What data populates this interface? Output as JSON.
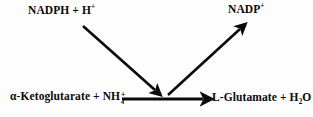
{
  "figure": {
    "kind": "biochemical-reaction-scheme",
    "background_color": "#fdfdfd",
    "stroke_color": "#0a0a0a",
    "width": 313,
    "height": 117
  },
  "species": {
    "reductant": {
      "name": "NADPH + H",
      "charge": "+",
      "full_text": "NADPH + H+"
    },
    "oxidant": {
      "name": "NADP",
      "charge": "+",
      "full_text": "NADP+"
    },
    "substrate": {
      "prefix": "α-Ketoglutarate + NH",
      "subscript": "4",
      "charge": "+",
      "full_text": "α-Ketoglutarate + NH4+"
    },
    "product": {
      "prefix": "L-Glutamate + H",
      "subscript": "2",
      "suffix": "O",
      "full_text": "L-Glutamate + H2O"
    }
  },
  "arrows": [
    {
      "id": "cofactor-in",
      "label": "NADPH + H+ consumed",
      "from": [
        83,
        26
      ],
      "to": [
        158,
        93
      ],
      "style": "solid-diagonal-down-right"
    },
    {
      "id": "cofactor-out",
      "label": "NADP+ released",
      "from": [
        168,
        95
      ],
      "to": [
        243,
        26
      ],
      "style": "solid-diagonal-up-right"
    },
    {
      "id": "main-reaction",
      "label": "α-Ketoglutarate + NH4+ to L-Glutamate + H2O",
      "from": [
        122,
        99
      ],
      "to": [
        207,
        99
      ],
      "style": "solid-horizontal-right"
    }
  ]
}
